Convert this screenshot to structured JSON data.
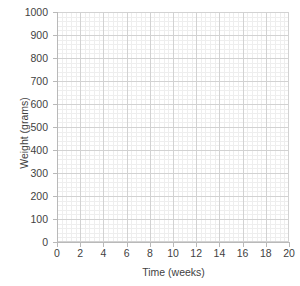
{
  "chart_data": {
    "type": "line",
    "title": "",
    "subtitle": "",
    "xlabel": "Time (weeks)",
    "ylabel": "Weight (grams)",
    "xlim": [
      0,
      20
    ],
    "ylim": [
      0,
      1000
    ],
    "x_ticks": [
      0,
      2,
      4,
      6,
      8,
      10,
      12,
      14,
      16,
      18,
      20
    ],
    "y_ticks": [
      0,
      100,
      200,
      300,
      400,
      500,
      600,
      700,
      800,
      900,
      1000
    ],
    "x_tick_labels": [
      "0",
      "2",
      "4",
      "6",
      "8",
      "10",
      "12",
      "14",
      "16",
      "18",
      "20"
    ],
    "y_tick_labels": [
      "0",
      "100",
      "200",
      "300",
      "400",
      "500",
      "600",
      "700",
      "800",
      "900",
      "1000"
    ],
    "x_major_step": 2,
    "y_major_step": 100,
    "x_minor_divisions": 5,
    "y_minor_divisions": 5,
    "grid": true,
    "minor_grid": true,
    "legend": false,
    "legend_position": "none",
    "series": [],
    "annotations": [],
    "note": "Blank grid template — no data series plotted",
    "colors": {
      "background": "#ffffff",
      "major_gridline": "#d2d2d2",
      "minor_gridline": "#e9e9e9",
      "axis_line": "#b9b9b9",
      "text": "#3f3f3f"
    }
  },
  "axes": {
    "y_axis_title": "Weight (grams)",
    "x_axis_title": "Time (weeks)"
  }
}
